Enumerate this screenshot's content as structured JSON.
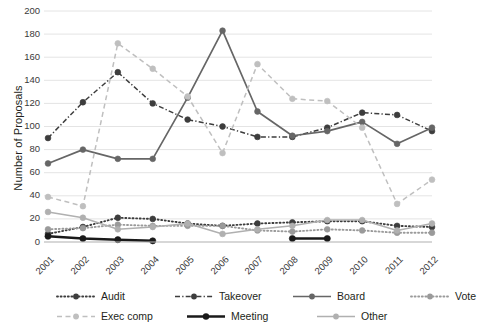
{
  "chart_data": {
    "type": "line",
    "title": "",
    "xlabel": "",
    "ylabel": "Number of Proposals",
    "x": [
      "2001",
      "2002",
      "2003",
      "2004",
      "2005",
      "2006",
      "2007",
      "2008",
      "2009",
      "2010",
      "2011",
      "2012"
    ],
    "ylim": [
      0,
      200
    ],
    "ytick_values": [
      0,
      20,
      40,
      60,
      80,
      100,
      120,
      140,
      160,
      180,
      200
    ],
    "ytick_labels": [
      "0",
      "20",
      "40",
      "60",
      "80",
      "100",
      "120",
      "140",
      "160",
      "180",
      "200"
    ],
    "grid": true,
    "legend_position": "bottom",
    "series": [
      {
        "name": "Audit",
        "color": "#3d3d3d",
        "style": "dotted",
        "values": [
          7,
          13,
          21,
          20,
          16,
          14,
          16,
          17,
          18,
          18,
          14,
          13
        ]
      },
      {
        "name": "Takeover",
        "color": "#3d3d3d",
        "style": "dashdot",
        "values": [
          90,
          121,
          147,
          120,
          106,
          100,
          91,
          91,
          99,
          112,
          110,
          96
        ]
      },
      {
        "name": "Board",
        "color": "#666666",
        "style": "solid",
        "values": [
          68,
          80,
          72,
          72,
          125,
          183,
          113,
          92,
          96,
          104,
          85,
          99
        ]
      },
      {
        "name": "Vote",
        "color": "#9a9a9a",
        "style": "dotted",
        "values": [
          11,
          12,
          15,
          14,
          14,
          14,
          10,
          9,
          11,
          10,
          8,
          8
        ]
      },
      {
        "name": "Exec comp",
        "color": "#bfbfbf",
        "style": "dashed",
        "values": [
          39,
          31,
          172,
          150,
          126,
          77,
          154,
          124,
          122,
          99,
          33,
          54
        ]
      },
      {
        "name": "Meeting",
        "color": "#1a1a1a",
        "style": "solid-thick",
        "values": [
          5,
          3,
          2,
          1,
          null,
          null,
          null,
          3,
          3,
          null,
          null,
          null
        ]
      },
      {
        "name": "Other",
        "color": "#b0b0b0",
        "style": "solid-light",
        "values": [
          26,
          21,
          11,
          13,
          16,
          7,
          11,
          14,
          19,
          19,
          10,
          16
        ]
      }
    ]
  },
  "legend": {
    "rows": [
      [
        {
          "label": "Audit",
          "series": 0
        },
        {
          "label": "Takeover",
          "series": 1
        },
        {
          "label": "Board",
          "series": 2
        },
        {
          "label": "Vote",
          "series": 3
        }
      ],
      [
        {
          "label": "Exec comp",
          "series": 4
        },
        {
          "label": "Meeting",
          "series": 5
        },
        {
          "label": "Other",
          "series": 6
        }
      ]
    ]
  }
}
